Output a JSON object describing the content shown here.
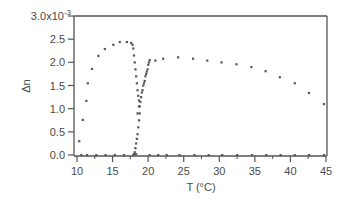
{
  "chart_data": {
    "type": "scatter",
    "title": "",
    "xlabel": "T (°C)",
    "ylabel": "Δn",
    "y_multiplier_label": "3.0x10",
    "y_multiplier_exp": "-3",
    "xlim": [
      10,
      45
    ],
    "ylim": [
      0,
      3.0
    ],
    "y_scale": "1e-3",
    "x_ticks": [
      10,
      15,
      20,
      25,
      30,
      35,
      40,
      45
    ],
    "x_tick_labels": [
      "10",
      "15",
      "20",
      "25",
      "30",
      "35",
      "40",
      "45"
    ],
    "y_ticks": [
      0.0,
      0.5,
      1.0,
      1.5,
      2.0,
      2.5,
      3.0
    ],
    "y_tick_labels": [
      "0.0",
      "0.5",
      "1.0",
      "1.5",
      "2.0",
      "2.5",
      "3.0x10"
    ],
    "grid": false,
    "legend": null,
    "marker_color": "#555555",
    "series": [
      {
        "name": "low-temperature phase",
        "x": [
          10.3,
          10.8,
          11.3,
          11.5,
          12.1,
          13.0,
          13.9,
          15.1,
          16.0,
          17.0,
          17.6,
          17.8,
          17.9,
          18.0,
          18.1,
          18.2,
          18.3,
          18.4,
          18.5,
          18.6,
          18.7,
          18.8,
          18.8,
          18.7,
          18.6,
          18.5,
          18.4,
          18.3,
          18.2,
          18.1,
          18.0
        ],
        "y": [
          0.3,
          0.76,
          1.17,
          1.55,
          1.86,
          2.14,
          2.29,
          2.38,
          2.44,
          2.44,
          2.42,
          2.38,
          2.3,
          2.15,
          2.0,
          1.85,
          1.7,
          1.55,
          1.4,
          1.28,
          1.18,
          1.05,
          0.9,
          0.75,
          0.6,
          0.45,
          0.35,
          0.25,
          0.15,
          0.06,
          0.02
        ]
      },
      {
        "name": "high-temperature phase",
        "x": [
          18.3,
          18.5,
          18.7,
          18.9,
          19.0,
          19.1,
          19.2,
          19.3,
          19.4,
          19.5,
          19.6,
          19.7,
          19.8,
          19.9,
          20.0,
          20.1,
          20.2,
          21.0,
          22.1,
          24.2,
          26.3,
          28.3,
          30.3,
          32.4,
          34.5,
          36.5,
          38.5,
          40.6,
          42.6,
          44.7
        ],
        "y": [
          0.02,
          0.9,
          1.05,
          1.15,
          1.25,
          1.35,
          1.4,
          1.5,
          1.55,
          1.6,
          1.7,
          1.75,
          1.8,
          1.85,
          1.95,
          2.0,
          2.05,
          2.04,
          2.08,
          2.11,
          2.08,
          2.04,
          2.0,
          1.96,
          1.9,
          1.81,
          1.68,
          1.55,
          1.34,
          1.1
        ]
      },
      {
        "name": "baseline",
        "x": [
          10.6,
          11.4,
          12.7,
          14.0,
          15.3,
          16.6,
          17.9,
          20.2,
          21.4,
          22.6,
          24.4,
          26.5,
          28.5,
          30.4,
          32.5,
          34.6,
          36.6,
          38.6,
          40.6,
          42.6,
          44.7
        ],
        "y": [
          0,
          0,
          0,
          0,
          0,
          0,
          0,
          0,
          0,
          0,
          0,
          0,
          0,
          0,
          0,
          0,
          0,
          0,
          0,
          0,
          0
        ]
      }
    ]
  }
}
